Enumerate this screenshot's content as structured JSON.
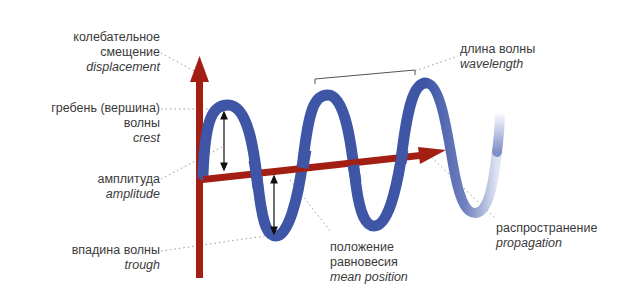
{
  "colors": {
    "wave": "#3f56a6",
    "axis": "#a31f14",
    "text": "#3a3a3a",
    "leader": "#9a9a9a"
  },
  "labels": {
    "displacement": {
      "ru1": "колебательное",
      "ru2": "смещение",
      "en": "displacement"
    },
    "crest": {
      "ru1": "гребень (вершина)",
      "ru2": "волны",
      "en": "crest"
    },
    "amplitude": {
      "ru": "амплитуда",
      "en": "amplitude"
    },
    "trough": {
      "ru": "впадина волны",
      "en": "trough"
    },
    "wavelength": {
      "ru": "длина волны",
      "en": "wavelength"
    },
    "mean_position": {
      "ru1": "положение",
      "ru2": "равновесия",
      "en": "mean position"
    },
    "propagation": {
      "ru": "распространение",
      "en": "propagation"
    }
  }
}
